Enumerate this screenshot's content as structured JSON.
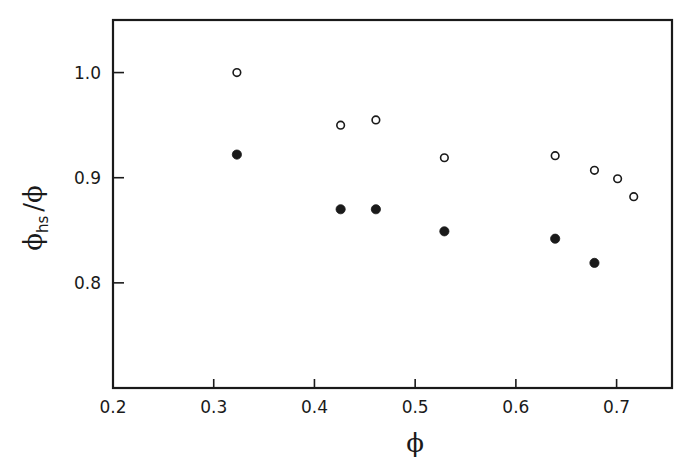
{
  "chart_data": {
    "type": "scatter",
    "title": "",
    "xlabel": "ϕ",
    "ylabel": "ϕhs/ϕ",
    "ylabel_parts": {
      "main": "ϕ",
      "sub": "hs",
      "denominator": "/ϕ"
    },
    "xlim": [
      0.2,
      0.755
    ],
    "ylim": [
      0.7,
      1.05
    ],
    "xticks": [
      0.2,
      0.3,
      0.4,
      0.5,
      0.6,
      0.7
    ],
    "xtick_labels": [
      "0.2",
      "0.3",
      "0.4",
      "0.5",
      "0.6",
      "0.7"
    ],
    "yticks": [
      0.8,
      0.9,
      1.0
    ],
    "ytick_labels": [
      "0.8",
      "0.9",
      "1.0"
    ],
    "grid": false,
    "legend": null,
    "series": [
      {
        "name": "open circles",
        "marker": "open-circle",
        "x": [
          0.323,
          0.426,
          0.461,
          0.529,
          0.639,
          0.678,
          0.701,
          0.717
        ],
        "y": [
          1.0,
          0.95,
          0.955,
          0.919,
          0.921,
          0.907,
          0.899,
          0.882
        ]
      },
      {
        "name": "filled circles",
        "marker": "filled-circle",
        "x": [
          0.323,
          0.426,
          0.461,
          0.529,
          0.639,
          0.678
        ],
        "y": [
          0.922,
          0.87,
          0.87,
          0.849,
          0.842,
          0.819
        ]
      }
    ]
  },
  "colors": {
    "ink": "#1a1a1a",
    "background": "#ffffff"
  }
}
